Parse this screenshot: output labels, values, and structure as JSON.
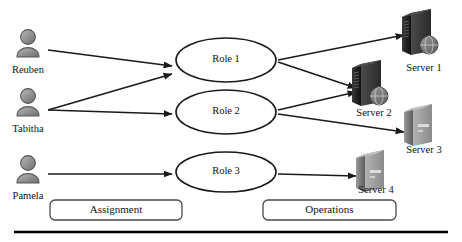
{
  "diagram": {
    "colors": {
      "stroke": "#1a1a1a",
      "text": "#111111",
      "avatar_fill": "#8c8c8c",
      "avatar_stroke": "#4d4d4d",
      "server_dark_fill": "#2b2b2b",
      "server_light_fill": "#8a8a8a",
      "box_stroke": "#4a4a4a",
      "rule": "#000000",
      "background": "#ffffff"
    },
    "persons": [
      {
        "id": "reuben",
        "label": "Reuben",
        "icon": "user-avatar-icon",
        "x": 28,
        "y": 46
      },
      {
        "id": "tabitha",
        "label": "Tabitha",
        "icon": "user-avatar-icon",
        "x": 28,
        "y": 105
      },
      {
        "id": "pamela",
        "label": "Pamela",
        "icon": "user-avatar-icon",
        "x": 28,
        "y": 172
      }
    ],
    "roles": [
      {
        "id": "role1",
        "label": "Role 1",
        "cx": 226,
        "cy": 60,
        "rx": 50,
        "ry": 22
      },
      {
        "id": "role2",
        "label": "Role 2",
        "cx": 226,
        "cy": 112,
        "rx": 50,
        "ry": 22
      },
      {
        "id": "role3",
        "label": "Role 3",
        "cx": 226,
        "cy": 172,
        "rx": 50,
        "ry": 20
      }
    ],
    "servers": [
      {
        "id": "server1",
        "label": "Server 1",
        "icon": "server-tower-dark-icon",
        "x": 424,
        "y": 35,
        "style": "dark"
      },
      {
        "id": "server2",
        "label": "Server 2",
        "icon": "server-tower-dark-icon",
        "x": 374,
        "y": 86,
        "style": "dark"
      },
      {
        "id": "server3",
        "label": "Server 3",
        "icon": "server-tower-light-icon",
        "x": 424,
        "y": 128,
        "style": "light"
      },
      {
        "id": "server4",
        "label": "Server 4",
        "icon": "server-tower-light-icon",
        "x": 376,
        "y": 174,
        "style": "light"
      }
    ],
    "assignment_edges": [
      {
        "from": "reuben",
        "to": "role1"
      },
      {
        "from": "tabitha",
        "to": "role1"
      },
      {
        "from": "tabitha",
        "to": "role2"
      },
      {
        "from": "pamela",
        "to": "role3"
      }
    ],
    "operation_edges": [
      {
        "from": "role1",
        "to": "server1"
      },
      {
        "from": "role1",
        "to": "server2"
      },
      {
        "from": "role2",
        "to": "server2"
      },
      {
        "from": "role2",
        "to": "server3"
      },
      {
        "from": "role3",
        "to": "server4"
      }
    ],
    "group_boxes": [
      {
        "id": "assignment",
        "label": "Assignment",
        "x": 50,
        "y": 200,
        "w": 132,
        "h": 20
      },
      {
        "id": "operations",
        "label": "Operations",
        "x": 263,
        "y": 200,
        "w": 133,
        "h": 20
      }
    ],
    "footer_rule": {
      "y": 232,
      "x1": 14,
      "x2": 448,
      "thickness": 2.4
    }
  }
}
